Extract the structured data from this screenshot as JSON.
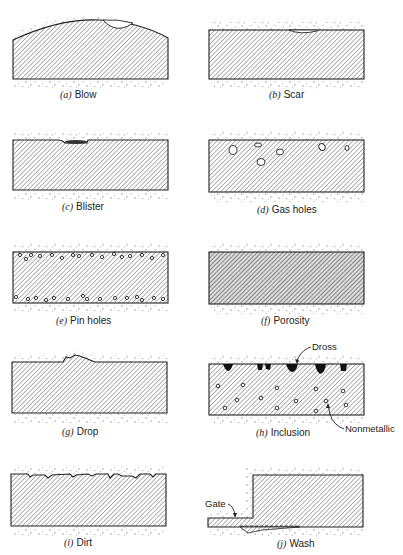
{
  "figure": {
    "panels": [
      {
        "id": "a",
        "letter": "(a)",
        "label": "Blow"
      },
      {
        "id": "b",
        "letter": "(b)",
        "label": "Scar"
      },
      {
        "id": "c",
        "letter": "(c)",
        "label": "Blister"
      },
      {
        "id": "d",
        "letter": "(d)",
        "label": "Gas holes"
      },
      {
        "id": "e",
        "letter": "(e)",
        "label": "Pin holes"
      },
      {
        "id": "f",
        "letter": "(f)",
        "label": "Porosity"
      },
      {
        "id": "g",
        "letter": "(g)",
        "label": "Drop"
      },
      {
        "id": "h",
        "letter": "(h)",
        "label": "Inclusion"
      },
      {
        "id": "i",
        "letter": "(i)",
        "label": "Dirt"
      },
      {
        "id": "j",
        "letter": "(j)",
        "label": "Wash"
      }
    ],
    "callouts": {
      "dross": "Dross",
      "nonmetallic": "Nonmetallic",
      "gate": "Gate"
    }
  }
}
